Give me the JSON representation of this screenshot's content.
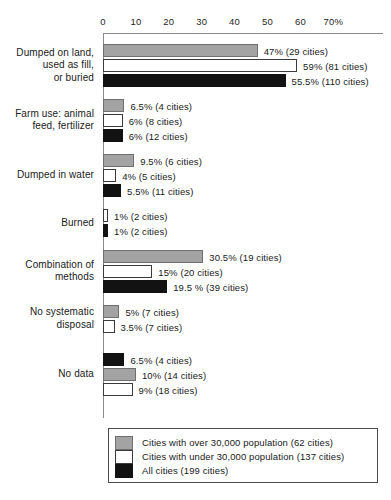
{
  "chart_data": {
    "type": "bar",
    "orientation": "horizontal",
    "title": "",
    "xlabel": "",
    "ylabel": "",
    "xlim": [
      0,
      70
    ],
    "grid": false,
    "legend_position": "bottom",
    "axis_ticks": [
      "0",
      "10",
      "20",
      "30",
      "40",
      "50",
      "60",
      "70%"
    ],
    "axis_tick_values": [
      0,
      10,
      20,
      30,
      40,
      50,
      60,
      70
    ],
    "series": [
      {
        "name": "Cities with over 30,000 population (62 cities)",
        "key": "over30k",
        "color": "#a3a3a3",
        "swatch": "gray"
      },
      {
        "name": "Cities with under 30,000 population (137 cities)",
        "key": "under30k",
        "color": "#ffffff",
        "swatch": "white"
      },
      {
        "name": "All cities (199 cities)",
        "key": "all",
        "color": "#121212",
        "swatch": "black"
      }
    ],
    "categories": [
      "Dumped on land,\nused as fill,\nor buried",
      "Farm use: animal\nfeed, fertilizer",
      "Dumped in water",
      "Burned",
      "Combination of\nmethods",
      "No systematic\ndisposal",
      "No data"
    ],
    "groups": [
      {
        "category": "Dumped on land,\nused as fill,\nor buried",
        "bars": [
          {
            "swatch": "gray",
            "value": 47,
            "label": "47% (29 cities)",
            "cities": 29
          },
          {
            "swatch": "white",
            "value": 59,
            "label": "59% (81 cities)",
            "cities": 81
          },
          {
            "swatch": "black",
            "value": 55.5,
            "label": "55.5% (110 cities)",
            "cities": 110
          }
        ]
      },
      {
        "category": "Farm use: animal\nfeed, fertilizer",
        "bars": [
          {
            "swatch": "gray",
            "value": 6.5,
            "label": "6.5% (4 cities)",
            "cities": 4
          },
          {
            "swatch": "white",
            "value": 6,
            "label": "6% (8 cities)",
            "cities": 8
          },
          {
            "swatch": "black",
            "value": 6,
            "label": "6% (12 cities)",
            "cities": 12
          }
        ]
      },
      {
        "category": "Dumped in water",
        "bars": [
          {
            "swatch": "gray",
            "value": 9.5,
            "label": "9.5% (6 cities)",
            "cities": 6
          },
          {
            "swatch": "white",
            "value": 4,
            "label": "4% (5 cities)",
            "cities": 5
          },
          {
            "swatch": "black",
            "value": 5.5,
            "label": "5.5% (11 cities)",
            "cities": 11
          }
        ]
      },
      {
        "category": "Burned",
        "bars": [
          {
            "swatch": "white",
            "value": 1,
            "label": "1% (2 cities)",
            "cities": 2
          },
          {
            "swatch": "black",
            "value": 1,
            "label": "1% (2 cities)",
            "cities": 2
          }
        ]
      },
      {
        "category": "Combination of\nmethods",
        "bars": [
          {
            "swatch": "gray",
            "value": 30.5,
            "label": "30.5% (19 cities)",
            "cities": 19
          },
          {
            "swatch": "white",
            "value": 15,
            "label": "15% (20 cities)",
            "cities": 20
          },
          {
            "swatch": "black",
            "value": 19.5,
            "label": "19.5 % (39 cities)",
            "cities": 39
          }
        ]
      },
      {
        "category": "No systematic\ndisposal",
        "bars": [
          {
            "swatch": "gray",
            "value": 5,
            "label": "5% (7 cities)",
            "cities": 7
          },
          {
            "swatch": "white",
            "value": 3.5,
            "label": "3.5% (7 cities)",
            "cities": 7
          }
        ]
      },
      {
        "category": "No data",
        "bars": [
          {
            "swatch": "black",
            "value": 6.5,
            "label": "6.5% (4 cities)",
            "cities": 4
          },
          {
            "swatch": "gray",
            "value": 10,
            "label": "10% (14 cities)",
            "cities": 14
          },
          {
            "swatch": "white",
            "value": 9,
            "label": "9% (18 cities)",
            "cities": 18
          }
        ]
      }
    ]
  },
  "legend": {
    "items": [
      {
        "swatch": "gray",
        "label": "Cities with over 30,000 population (62 cities)"
      },
      {
        "swatch": "white",
        "label": "Cities with under 30,000 population (137 cities)"
      },
      {
        "swatch": "black",
        "label": "All cities (199 cities)"
      }
    ]
  }
}
